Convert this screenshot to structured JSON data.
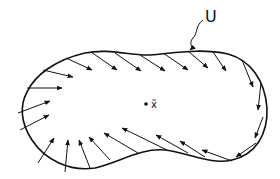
{
  "figure": {
    "region_label": "U",
    "point_label": "x̃",
    "stroke_color": "#111111",
    "background": "#ffffff"
  },
  "outline": "M 27 92 C 35 75, 55 60, 85 53 C 110 48, 130 56, 150 55 C 175 53, 200 48, 228 54 C 250 60, 265 80, 267 108 C 268 135, 255 155, 232 160 C 210 165, 190 153, 165 150 C 140 148, 120 162, 95 168 C 70 172, 45 160, 32 140 C 20 122, 20 105, 27 92 Z",
  "arrows": [
    [
      66,
      58,
      92,
      70
    ],
    [
      43,
      70,
      73,
      77
    ],
    [
      27,
      88,
      62,
      88
    ],
    [
      18,
      113,
      50,
      101
    ],
    [
      20,
      130,
      49,
      115
    ],
    [
      38,
      163,
      54,
      138
    ],
    [
      65,
      172,
      68,
      140
    ],
    [
      90,
      168,
      79,
      140
    ],
    [
      110,
      160,
      89,
      137
    ],
    [
      138,
      153,
      104,
      133
    ],
    [
      167,
      150,
      122,
      128
    ],
    [
      188,
      153,
      156,
      135
    ],
    [
      205,
      157,
      180,
      141
    ],
    [
      232,
      161,
      202,
      150
    ],
    [
      256,
      143,
      236,
      157
    ],
    [
      263,
      117,
      255,
      138
    ],
    [
      261,
      83,
      258,
      110
    ],
    [
      242,
      60,
      253,
      87
    ],
    [
      213,
      52,
      226,
      71
    ],
    [
      188,
      51,
      208,
      68
    ],
    [
      163,
      53,
      188,
      70
    ],
    [
      140,
      55,
      165,
      71
    ],
    [
      115,
      53,
      141,
      71
    ],
    [
      91,
      52,
      117,
      70
    ]
  ],
  "squiggle": "M 203 20 C 195 26, 198 33, 193 38 C 188 43, 194 47, 190 50",
  "point": {
    "x": 146,
    "y": 104
  }
}
